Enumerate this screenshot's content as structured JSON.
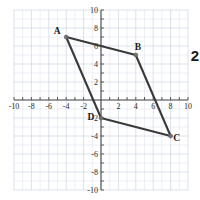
{
  "chart_data": {
    "type": "scatter",
    "title": "",
    "subtitle": "",
    "xlabel": "",
    "ylabel": "",
    "xlim": [
      -10,
      10
    ],
    "ylim": [
      -10,
      10
    ],
    "grid": true,
    "grid_step": 1,
    "legend": "none",
    "x_ticks": [
      -10,
      -8,
      -6,
      -4,
      -2,
      2,
      4,
      6,
      8,
      10
    ],
    "x_tick_labels": [
      "-10",
      "-8",
      "-6",
      "-4",
      "-2",
      "2",
      "4",
      "6",
      "8",
      "10"
    ],
    "y_ticks": [
      10,
      8,
      6,
      4,
      2,
      -2,
      -4,
      -6,
      -8,
      -10
    ],
    "y_tick_labels": [
      "10",
      "8",
      "6",
      "4",
      "2",
      "-2",
      "-4",
      "-6",
      "-8",
      "-10"
    ],
    "shape": "quadrilateral",
    "vertices": [
      {
        "label": "A",
        "x": -4,
        "y": 7
      },
      {
        "label": "B",
        "x": 4,
        "y": 5
      },
      {
        "label": "C",
        "x": 8,
        "y": -4
      },
      {
        "label": "D",
        "x": 0,
        "y": -2
      }
    ],
    "edges": [
      {
        "from": "A",
        "to": "B"
      },
      {
        "from": "B",
        "to": "C"
      },
      {
        "from": "C",
        "to": "D"
      },
      {
        "from": "D",
        "to": "A"
      }
    ],
    "colors": {
      "shape_stroke": "#3a3a3a",
      "vertex_fill": "#6f6f6f",
      "grid": "#dfe4ee",
      "axis": "#4a4a4a",
      "label_text": "#1a1a1a",
      "background": "#ffffff"
    }
  },
  "annotations": {
    "side_number": "2"
  }
}
